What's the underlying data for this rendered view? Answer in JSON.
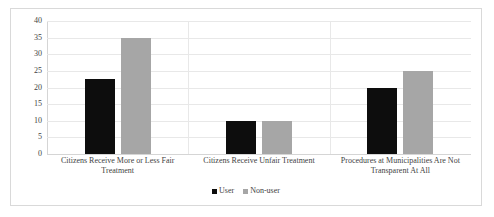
{
  "chart_data": {
    "type": "bar",
    "title": "",
    "subtitle": "",
    "xlabel": "",
    "ylabel": "",
    "ylim": [
      0,
      40
    ],
    "yticks": [
      0,
      5,
      10,
      15,
      20,
      25,
      30,
      35,
      40
    ],
    "ytick_labels": [
      "0",
      "5",
      "10",
      "15",
      "20",
      "25",
      "30",
      "35",
      "40"
    ],
    "grid": "horizontal",
    "legend_position": "bottom-center",
    "categories": [
      "Citizens Receive More or Less Fair Treatment",
      "Citizens Receive Unfair Treatment",
      "Procedures at Municipalities Are Not Transparent At All"
    ],
    "category_lines": [
      [
        "Citizens Receive More or Less Fair",
        "Treatment"
      ],
      [
        "Citizens Receive Unfair Treatment"
      ],
      [
        "Procedures at Municipalities Are Not",
        "Transparent At All"
      ]
    ],
    "series": [
      {
        "name": "User",
        "color": "#0d0d0d",
        "values": [
          22.5,
          10,
          20
        ]
      },
      {
        "name": "Non-user",
        "color": "#a6a6a6",
        "values": [
          35,
          10,
          25
        ]
      }
    ]
  },
  "legend": {
    "items": [
      {
        "label": "User",
        "marker": "square-black"
      },
      {
        "label": "Non-user",
        "marker": "square-gray"
      }
    ]
  },
  "colors": {
    "user": "#0d0d0d",
    "nonuser": "#a6a6a6",
    "gridline": "#e8e8e8",
    "frame_border": "#d9d9d9",
    "text": "#3f3f3f",
    "background": "#ffffff"
  }
}
